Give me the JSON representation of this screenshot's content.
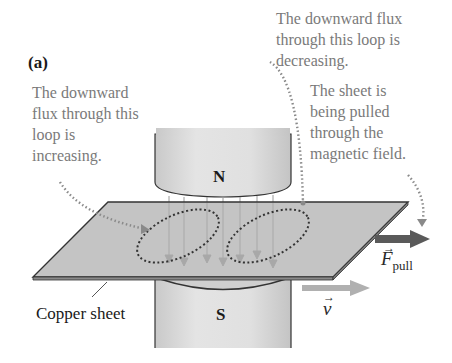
{
  "figure": {
    "panel_label": "(a)",
    "annotations": {
      "left_loop": "The downward\nflux through this\nloop is\nincreasing.",
      "right_loop": "The downward flux\nthrough this loop is\ndecreasing.",
      "sheet_motion": "The sheet is\nbeing pulled\nthrough the\nmagnetic field."
    },
    "labels": {
      "north_pole": "N",
      "south_pole": "S",
      "copper_sheet": "Copper sheet",
      "force_symbol": "F",
      "force_subscript": "pull",
      "velocity_symbol": "v"
    },
    "colors": {
      "sheet_fill": "#c4c4c4",
      "sheet_edge": "#3a3a3a",
      "magnet_fill": "#d8d8d8",
      "field_line": "#a0a0a0",
      "loop_dots": "#3a3a3a",
      "annotation_dots": "#8a8a8a",
      "force_arrow": "#5a5a5a",
      "velocity_arrow": "#b0b0b0",
      "annotation_text": "#7a7a7a"
    }
  }
}
